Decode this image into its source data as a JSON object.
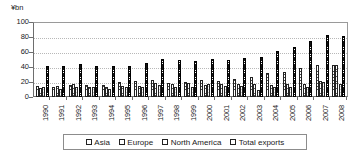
{
  "chart_data": {
    "type": "bar",
    "title": "",
    "subtitle": "",
    "xlabel": "",
    "ylabel": "¥bn",
    "ylim": [
      0,
      100
    ],
    "yticks": [
      0,
      20,
      40,
      60,
      80,
      100
    ],
    "grid": true,
    "legend_position": "bottom",
    "categories": [
      "1990",
      "1991",
      "1992",
      "1993",
      "1994",
      "1995",
      "1996",
      "1997",
      "1998",
      "1999",
      "2000",
      "2001",
      "2002",
      "2003",
      "2004",
      "2005",
      "2006",
      "2007",
      "2008"
    ],
    "series": [
      {
        "name": "Asia",
        "pattern": "cross-hatch",
        "values": [
          14,
          13,
          15,
          15,
          15,
          19,
          20,
          22,
          18,
          19,
          22,
          20,
          23,
          26,
          31,
          33,
          38,
          42,
          42
        ]
      },
      {
        "name": "Europe",
        "pattern": "horizontal-hatch",
        "values": [
          11,
          14,
          16,
          12,
          12,
          14,
          14,
          18,
          17,
          18,
          15,
          16,
          16,
          16,
          15,
          16,
          16,
          20,
          42
        ]
      },
      {
        "name": "North America",
        "pattern": "light",
        "values": [
          12,
          10,
          12,
          13,
          10,
          12,
          13,
          15,
          13,
          12,
          16,
          14,
          14,
          9,
          12,
          12,
          13,
          19,
          17
        ]
      },
      {
        "name": "Total exports",
        "pattern": "dark-dotted",
        "values": [
          41,
          41,
          43,
          40,
          40,
          41,
          44,
          50,
          49,
          47,
          50,
          48,
          51,
          53,
          60,
          65,
          74,
          82,
          80
        ]
      }
    ]
  },
  "legend": {
    "items": [
      {
        "label": "Asia"
      },
      {
        "label": "Europe"
      },
      {
        "label": "North America"
      },
      {
        "label": "Total exports"
      }
    ]
  }
}
